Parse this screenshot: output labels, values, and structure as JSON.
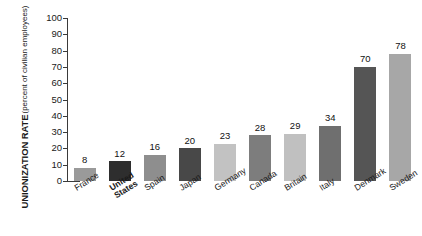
{
  "chart_data": {
    "type": "bar",
    "title": "",
    "subtitle": "",
    "xlabel": "",
    "ylabel": "UNIONIZATION RATE",
    "ylabel_sub": "(percent of civilian employees)",
    "ylim": [
      0,
      100
    ],
    "yticks": [
      100,
      90,
      80,
      70,
      60,
      50,
      40,
      30,
      20,
      10,
      0
    ],
    "grid": false,
    "legend": "none",
    "categories": [
      "France",
      "United States",
      "Spain",
      "Japan",
      "Germany",
      "Canada",
      "Britain",
      "Italy",
      "Denmark",
      "Sweden"
    ],
    "category_labels_display": [
      "France",
      "United\nStates",
      "Spain",
      "Japan",
      "Germany",
      "Canada",
      "Britain",
      "Italy",
      "Denmark",
      "Sweden"
    ],
    "values": [
      8,
      12,
      16,
      20,
      23,
      28,
      29,
      34,
      70,
      78
    ],
    "bar_colors": [
      "#9a9a9a",
      "#2e2e2e",
      "#8e8e8e",
      "#484848",
      "#c2c2c2",
      "#7d7d7d",
      "#c0c0c0",
      "#6f6f6f",
      "#555555",
      "#a7a7a7"
    ],
    "highlighted_category": "United States",
    "axis_color": "#3a3a3a",
    "background_color": "#ffffff",
    "text_color": "#1a1a1a"
  }
}
